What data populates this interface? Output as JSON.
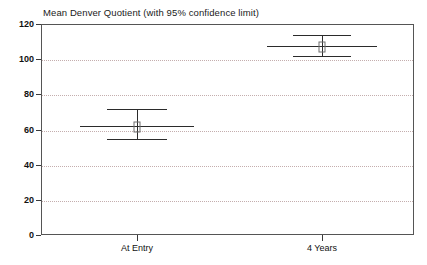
{
  "chart_data": {
    "type": "scatter",
    "title": "Mean Denver Quotient (with 95% confidence limit)",
    "subtitle": "",
    "xlabel": "",
    "ylabel": "",
    "categories": [
      "At Entry",
      "4 Years"
    ],
    "values": [
      62,
      107.5
    ],
    "error_low": [
      54.5,
      102
    ],
    "error_high": [
      71.5,
      114
    ],
    "series": [
      {
        "name": "Mean Denver Quotient",
        "points": [
          {
            "category": "At Entry",
            "mean": 62,
            "ci_lower": 54.5,
            "ci_upper": 114
          },
          {
            "category": "4 Years",
            "mean": 107.5,
            "ci_lower": 102,
            "ci_upper": 114
          }
        ]
      }
    ],
    "ylim": [
      0,
      120
    ],
    "yticks": [
      0,
      20,
      40,
      60,
      80,
      100,
      120
    ],
    "ytick_labels": [
      "0",
      "20",
      "40",
      "60",
      "80",
      "100",
      "120"
    ],
    "gridlines_at": [
      20,
      40,
      60,
      80,
      100
    ],
    "grid": true,
    "legend": "none",
    "marker_style": "open-square",
    "colors": {
      "frame": "#555555",
      "grid": "#c4aeae",
      "error_bar": "#2b2b2b",
      "marker_outline": "#6e6e6e",
      "background": "#ffffff",
      "text": "#111111"
    }
  },
  "axes": {
    "y": {
      "ticks": [
        {
          "value": 120,
          "label": "120"
        },
        {
          "value": 100,
          "label": "100"
        },
        {
          "value": 80,
          "label": "80"
        },
        {
          "value": 60,
          "label": "60"
        },
        {
          "value": 40,
          "label": "40"
        },
        {
          "value": 20,
          "label": "20"
        },
        {
          "value": 0,
          "label": "0"
        }
      ]
    },
    "x": {
      "ticks": [
        {
          "label": "At Entry"
        },
        {
          "label": "4 Years"
        }
      ]
    }
  }
}
